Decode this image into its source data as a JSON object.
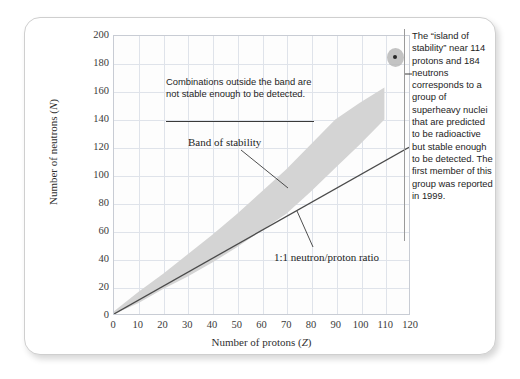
{
  "chart_data": {
    "type": "area",
    "title": "",
    "xlabel": "Number of protons (Z)",
    "ylabel": "Number of neutrons (N)",
    "xlim": [
      0,
      120
    ],
    "ylim": [
      0,
      200
    ],
    "xticks": [
      0,
      10,
      20,
      30,
      40,
      50,
      60,
      70,
      80,
      90,
      100,
      110,
      120
    ],
    "yticks": [
      0,
      20,
      40,
      60,
      80,
      100,
      120,
      140,
      160,
      180,
      200
    ],
    "grid": true,
    "legend_position": "none",
    "series": [
      {
        "name": "Band of stability",
        "type": "band",
        "fill_color": "#d4d4d4",
        "x": [
          0,
          10,
          20,
          30,
          40,
          50,
          60,
          70,
          80,
          90,
          100,
          110
        ],
        "upper": [
          2,
          16,
          29,
          43,
          57,
          72,
          88,
          104,
          122,
          140,
          152,
          163
        ],
        "lower": [
          0,
          8,
          18,
          27,
          37,
          48,
          60,
          72,
          88,
          105,
          122,
          140
        ]
      },
      {
        "name": "1:1 neutron/proton ratio",
        "type": "line",
        "color": "#4a4a4a",
        "x": [
          0,
          120
        ],
        "y": [
          0,
          120
        ]
      },
      {
        "name": "island of stability",
        "type": "scatter",
        "color": "#262626",
        "halo_color": "#b9b9b9",
        "x": [
          114
        ],
        "y": [
          184
        ]
      }
    ],
    "annotations": [
      {
        "name": "combinations-outside-note",
        "text": "Combinations outside the band are not stable enough to be detected.",
        "has_rule": true
      },
      {
        "name": "band-of-stability-label",
        "text": "Band of stability",
        "points_to": [
          72,
          97
        ]
      },
      {
        "name": "ratio-label",
        "text": "1:1 neutron/proton ratio",
        "points_to": [
          84,
          84
        ]
      },
      {
        "name": "island-of-stability-note",
        "text": "The “island of stability” near 114 protons and 184 neutrons corresponds to a group of superheavy nuclei that are predicted to be radioactive but stable enough to be detected. The first member of this group was reported in 1999.",
        "points_to": [
          114,
          184
        ]
      }
    ]
  },
  "figure": {
    "axis": {
      "y_title_main": "Number of neutrons (",
      "y_title_italic": "N",
      "y_title_close": ")",
      "x_title_main": "Number of protons (",
      "x_title_italic": "Z",
      "x_title_close": ")"
    },
    "notes": {
      "outside_band": "Combinations outside the band are not stable enough to be detected.",
      "band_of_stability": "Band of stability",
      "ratio": "1:1 neutron/proton ratio",
      "island": "The “island of stability” near 114 protons and 184 neutrons corresponds to a group of superheavy nuclei that are predicted to be radioactive but stable enough to be detected. The first member of this group was reported in 1999."
    }
  },
  "colors": {
    "band_fill": "#d4d4d4",
    "ratio_line": "#4a4a4a",
    "gridline": "#dfe3ea",
    "plot_border": "#c8ccd4",
    "marker_dot": "#262626",
    "marker_halo": "#b9b9b9",
    "card_bg": "#ffffff"
  }
}
